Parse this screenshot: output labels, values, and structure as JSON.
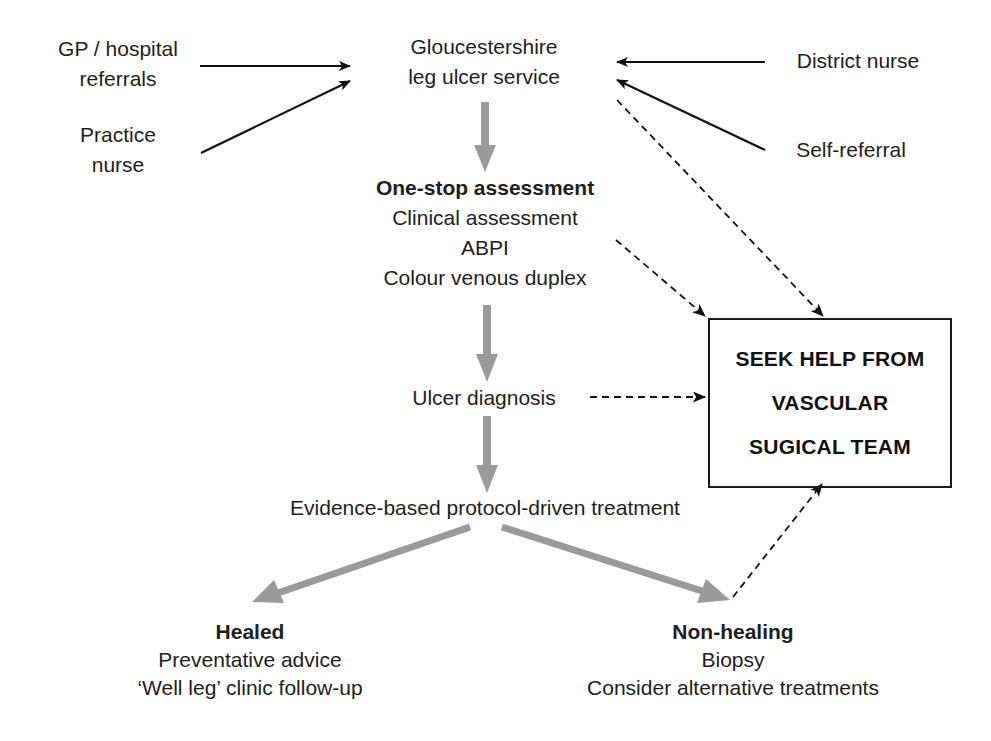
{
  "diagram": {
    "type": "flowchart",
    "colors": {
      "text": "#1e1e1e",
      "solid_arrow": "#111111",
      "dashed_arrow": "#111111",
      "main_flow_arrow": "#9a9a9a",
      "box_border": "#1a1a1a",
      "background": "#ffffff"
    },
    "sources": [
      {
        "id": "gp",
        "lines": [
          "GP / hospital",
          "referrals"
        ]
      },
      {
        "id": "practice",
        "lines": [
          "Practice",
          "nurse"
        ]
      },
      {
        "id": "district",
        "lines": [
          "District nurse"
        ]
      },
      {
        "id": "self",
        "lines": [
          "Self-referral"
        ]
      }
    ],
    "service": {
      "lines": [
        "Gloucestershire",
        "leg ulcer service"
      ]
    },
    "assessment": {
      "title": "One-stop assessment",
      "items": [
        "Clinical assessment",
        "ABPI",
        "Colour venous duplex"
      ]
    },
    "diagnosis": {
      "label": "Ulcer diagnosis"
    },
    "treatment": {
      "label": "Evidence-based protocol-driven treatment"
    },
    "healed": {
      "title": "Healed",
      "items": [
        "Preventative advice",
        "‘Well leg’ clinic follow-up"
      ]
    },
    "non_healing": {
      "title": "Non-healing",
      "items": [
        "Biopsy",
        "Consider alternative treatments"
      ]
    },
    "vascular_box": {
      "lines": [
        "SEEK HELP FROM",
        "VASCULAR",
        "SUGICAL TEAM"
      ]
    },
    "edges": [
      {
        "from": "GP / hospital referrals",
        "to": "Gloucestershire leg ulcer service",
        "style": "solid"
      },
      {
        "from": "Practice nurse",
        "to": "Gloucestershire leg ulcer service",
        "style": "solid"
      },
      {
        "from": "District nurse",
        "to": "Gloucestershire leg ulcer service",
        "style": "solid"
      },
      {
        "from": "Self-referral",
        "to": "Gloucestershire leg ulcer service",
        "style": "solid"
      },
      {
        "from": "Gloucestershire leg ulcer service",
        "to": "One-stop assessment",
        "style": "thick-gray"
      },
      {
        "from": "One-stop assessment",
        "to": "Ulcer diagnosis",
        "style": "thick-gray"
      },
      {
        "from": "Ulcer diagnosis",
        "to": "Evidence-based protocol-driven treatment",
        "style": "thick-gray"
      },
      {
        "from": "Evidence-based protocol-driven treatment",
        "to": "Healed",
        "style": "thick-gray"
      },
      {
        "from": "Evidence-based protocol-driven treatment",
        "to": "Non-healing",
        "style": "thick-gray"
      },
      {
        "from": "Gloucestershire leg ulcer service",
        "to": "SEEK HELP FROM VASCULAR SUGICAL TEAM",
        "style": "dashed"
      },
      {
        "from": "One-stop assessment",
        "to": "SEEK HELP FROM VASCULAR SUGICAL TEAM",
        "style": "dashed"
      },
      {
        "from": "Ulcer diagnosis",
        "to": "SEEK HELP FROM VASCULAR SUGICAL TEAM",
        "style": "dashed"
      },
      {
        "from": "Non-healing",
        "to": "SEEK HELP FROM VASCULAR SUGICAL TEAM",
        "style": "dashed"
      }
    ]
  }
}
